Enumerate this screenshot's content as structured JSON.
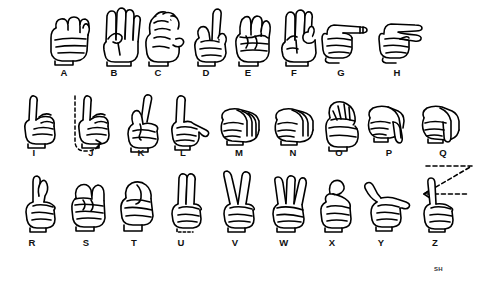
{
  "chart": {
    "title_visible": false,
    "background_color": "#ffffff",
    "ink_color": "#000000",
    "signature": "SH",
    "signature_position": {
      "x": 434,
      "y": 266
    },
    "rows": [
      {
        "row_index": 0,
        "sign_top": 6,
        "label_top": 68,
        "letters": [
          {
            "letter": "A",
            "shape": "closed-fist-thumb-side",
            "sign_x": 42,
            "label_x": 54,
            "orientation": "palm-out"
          },
          {
            "letter": "B",
            "shape": "flat-hand-fingers-up-thumb-across",
            "sign_x": 91,
            "label_x": 104,
            "orientation": "palm-out"
          },
          {
            "letter": "C",
            "shape": "curved-hand-c-shape",
            "sign_x": 135,
            "label_x": 148,
            "orientation": "palm-side"
          },
          {
            "letter": "D",
            "shape": "index-up-thumb-meets-fingers",
            "sign_x": 183,
            "label_x": 196,
            "orientation": "palm-out"
          },
          {
            "letter": "E",
            "shape": "fingers-curled-thumb-tucked",
            "sign_x": 224,
            "label_x": 238,
            "orientation": "palm-out"
          },
          {
            "letter": "F",
            "shape": "thumb-index-circle-three-up",
            "sign_x": 270,
            "label_x": 284,
            "orientation": "palm-out"
          },
          {
            "letter": "G",
            "shape": "index-pointing-sideways",
            "sign_x": 315,
            "label_x": 331,
            "orientation": "palm-side-horizontal"
          },
          {
            "letter": "H",
            "shape": "two-fingers-pointing-sideways",
            "sign_x": 372,
            "label_x": 387,
            "orientation": "palm-side-horizontal"
          }
        ]
      },
      {
        "row_index": 1,
        "sign_top": 92,
        "label_top": 148,
        "letters": [
          {
            "letter": "I",
            "shape": "pinky-up-fist",
            "sign_x": 12,
            "label_x": 24,
            "orientation": "palm-out"
          },
          {
            "letter": "J",
            "shape": "pinky-up-with-hook-motion",
            "sign_x": 66,
            "label_x": 81,
            "orientation": "palm-out",
            "motion": "j-hook-dashed"
          },
          {
            "letter": "K",
            "shape": "index-middle-up-thumb-between",
            "sign_x": 115,
            "label_x": 131,
            "orientation": "palm-out"
          },
          {
            "letter": "L",
            "shape": "index-up-thumb-out-l-shape",
            "sign_x": 158,
            "label_x": 173,
            "orientation": "palm-out"
          },
          {
            "letter": "M",
            "shape": "three-fingers-over-thumb",
            "sign_x": 213,
            "label_x": 229,
            "orientation": "palm-down"
          },
          {
            "letter": "N",
            "shape": "two-fingers-over-thumb",
            "sign_x": 267,
            "label_x": 283,
            "orientation": "palm-down"
          },
          {
            "letter": "O",
            "shape": "fingers-thumb-form-circle",
            "sign_x": 314,
            "label_x": 329,
            "orientation": "palm-out"
          },
          {
            "letter": "P",
            "shape": "k-shape-pointing-down",
            "sign_x": 362,
            "label_x": 379,
            "orientation": "palm-down"
          },
          {
            "letter": "Q",
            "shape": "g-shape-pointing-down",
            "sign_x": 416,
            "label_x": 433,
            "orientation": "palm-down"
          }
        ]
      },
      {
        "row_index": 2,
        "sign_top": 172,
        "label_top": 238,
        "letters": [
          {
            "letter": "R",
            "shape": "index-middle-crossed",
            "sign_x": 11,
            "label_x": 22,
            "orientation": "palm-out"
          },
          {
            "letter": "S",
            "shape": "fist-thumb-over-fingers",
            "sign_x": 61,
            "label_x": 76,
            "orientation": "palm-out"
          },
          {
            "letter": "T",
            "shape": "thumb-between-index-middle",
            "sign_x": 110,
            "label_x": 124,
            "orientation": "palm-out"
          },
          {
            "letter": "U",
            "shape": "index-middle-together-up",
            "sign_x": 157,
            "label_x": 171,
            "orientation": "palm-out"
          },
          {
            "letter": "V",
            "shape": "index-middle-apart-up",
            "sign_x": 210,
            "label_x": 225,
            "orientation": "palm-out"
          },
          {
            "letter": "W",
            "shape": "three-fingers-up",
            "sign_x": 260,
            "label_x": 274,
            "orientation": "palm-out"
          },
          {
            "letter": "X",
            "shape": "index-hooked",
            "sign_x": 308,
            "label_x": 322,
            "orientation": "palm-out"
          },
          {
            "letter": "Y",
            "shape": "thumb-pinky-extended",
            "sign_x": 357,
            "label_x": 371,
            "orientation": "palm-out"
          },
          {
            "letter": "Z",
            "shape": "index-up-with-zigzag-motion",
            "sign_x": 408,
            "label_x": 425,
            "orientation": "palm-out",
            "motion": "z-zigzag-dashed"
          }
        ]
      }
    ]
  }
}
